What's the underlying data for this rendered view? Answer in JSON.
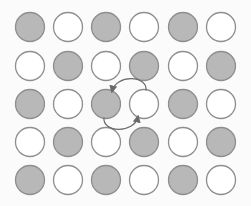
{
  "diagram": {
    "type": "checkerboard-swap",
    "columns": 6,
    "rows": 5,
    "col_centers": [
      30,
      68,
      106,
      144,
      183,
      221
    ],
    "row_centers": [
      27,
      66,
      104,
      142,
      180
    ],
    "circle_radius": 14.5,
    "colors": {
      "filled": "#b8b8b8",
      "filled_stroke": "#8e8e8e",
      "empty": "#ffffff",
      "empty_stroke": "#8e8e8e",
      "arrow": "#6a6a6a"
    },
    "grid": [
      [
        "G",
        "W",
        "G",
        "W",
        "G",
        "W"
      ],
      [
        "W",
        "G",
        "W",
        "G",
        "W",
        "G"
      ],
      [
        "G",
        "W",
        "G",
        "W",
        "G",
        "W"
      ],
      [
        "W",
        "G",
        "W",
        "G",
        "W",
        "G"
      ],
      [
        "G",
        "W",
        "G",
        "W",
        "G",
        "W"
      ]
    ],
    "swap": {
      "row": 2,
      "from_col": 2,
      "to_col": 3,
      "arrow_icon": "swap-arrows-icon"
    }
  }
}
